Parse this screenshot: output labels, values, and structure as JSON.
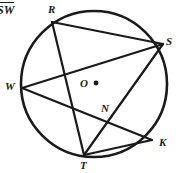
{
  "figure": {
    "caption": "SW",
    "caption_overline": true,
    "background_color": "#ffffff",
    "stroke_color": "#1a1a1a",
    "circle": {
      "name": "circle-O",
      "center_x": 94,
      "center_y": 84,
      "radius": 73,
      "stroke_width": 2.6
    },
    "center_point": {
      "label": "O",
      "dot_x": 96,
      "dot_y": 83,
      "dot_radius": 2.4,
      "label_x": 80,
      "label_y": 78
    },
    "points": [
      {
        "label": "R",
        "x": 52,
        "y": 22,
        "label_x": 48,
        "label_y": 4
      },
      {
        "label": "S",
        "x": 163,
        "y": 44,
        "label_x": 166,
        "label_y": 36
      },
      {
        "label": "W",
        "x": 22,
        "y": 88,
        "label_x": 5,
        "label_y": 81
      },
      {
        "label": "N",
        "x": 108,
        "y": 117,
        "label_x": 101,
        "label_y": 103
      },
      {
        "label": "K",
        "x": 152,
        "y": 140,
        "label_x": 159,
        "label_y": 137
      },
      {
        "label": "T",
        "x": 84,
        "y": 155,
        "label_x": 80,
        "label_y": 160
      }
    ],
    "chords": [
      {
        "name": "chord-RS",
        "from": "R",
        "to": "S",
        "x1": 52,
        "y1": 22,
        "x2": 163,
        "y2": 44
      },
      {
        "name": "chord-RT",
        "from": "R",
        "to": "T",
        "x1": 52,
        "y1": 22,
        "x2": 84,
        "y2": 155
      },
      {
        "name": "chord-WS",
        "from": "W",
        "to": "S",
        "x1": 22,
        "y1": 88,
        "x2": 163,
        "y2": 44
      },
      {
        "name": "chord-WK",
        "from": "W",
        "to": "K",
        "x1": 22,
        "y1": 88,
        "x2": 152,
        "y2": 140
      },
      {
        "name": "chord-ST",
        "from": "S",
        "to": "T",
        "x1": 163,
        "y1": 44,
        "x2": 84,
        "y2": 155
      },
      {
        "name": "chord-TK",
        "from": "T",
        "to": "K",
        "x1": 84,
        "y1": 155,
        "x2": 152,
        "y2": 140
      }
    ]
  }
}
